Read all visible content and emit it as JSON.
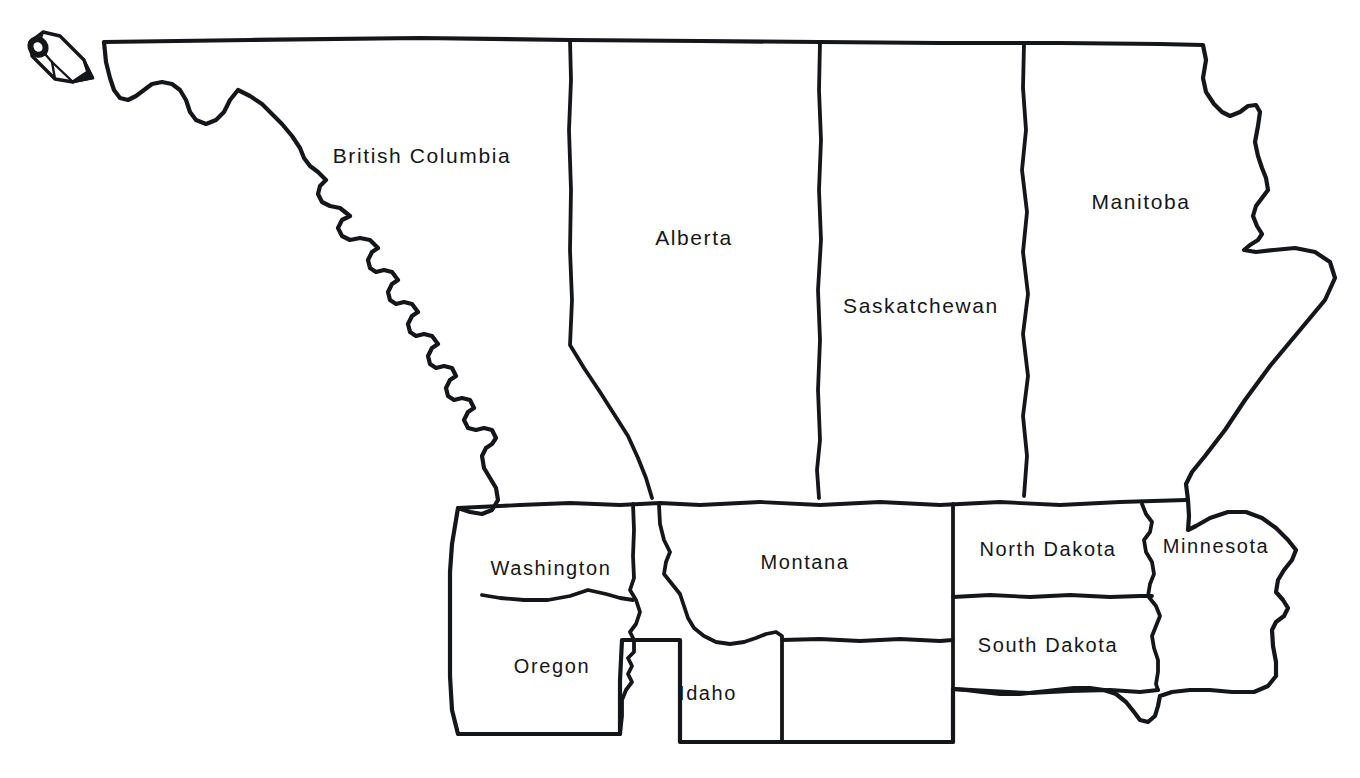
{
  "map": {
    "title": "Northwestern North America outline map",
    "background_color": "#ffffff",
    "line_color": "#15161a",
    "decoration": {
      "pencil_icon": "pencil-icon"
    },
    "regions": [
      {
        "id": "british-columbia",
        "label": "British Columbia",
        "type": "province",
        "country": "Canada",
        "label_x": 422,
        "label_y": 156,
        "font_size": 21
      },
      {
        "id": "alberta",
        "label": "Alberta",
        "type": "province",
        "country": "Canada",
        "label_x": 694,
        "label_y": 238,
        "font_size": 21
      },
      {
        "id": "saskatchewan",
        "label": "Saskatchewan",
        "type": "province",
        "country": "Canada",
        "label_x": 921,
        "label_y": 306,
        "font_size": 21
      },
      {
        "id": "manitoba",
        "label": "Manitoba",
        "type": "province",
        "country": "Canada",
        "label_x": 1141,
        "label_y": 202,
        "font_size": 21
      },
      {
        "id": "washington",
        "label": "Washington",
        "type": "state",
        "country": "United States",
        "label_x": 551,
        "label_y": 568,
        "font_size": 20
      },
      {
        "id": "oregon",
        "label": "Oregon",
        "type": "state",
        "country": "United States",
        "label_x": 552,
        "label_y": 666,
        "font_size": 20
      },
      {
        "id": "idaho",
        "label": "Idaho",
        "type": "state",
        "country": "United States",
        "label_x": 708,
        "label_y": 693,
        "font_size": 20
      },
      {
        "id": "montana",
        "label": "Montana",
        "type": "state",
        "country": "United States",
        "label_x": 805,
        "label_y": 562,
        "font_size": 20
      },
      {
        "id": "north-dakota",
        "label": "North Dakota",
        "type": "state",
        "country": "United States",
        "label_x": 1048,
        "label_y": 549,
        "font_size": 20
      },
      {
        "id": "south-dakota",
        "label": "South Dakota",
        "type": "state",
        "country": "United States",
        "label_x": 1048,
        "label_y": 645,
        "font_size": 20
      },
      {
        "id": "minnesota",
        "label": "Minnesota",
        "type": "state",
        "country": "United States",
        "label_x": 1216,
        "label_y": 546,
        "font_size": 20
      }
    ]
  }
}
